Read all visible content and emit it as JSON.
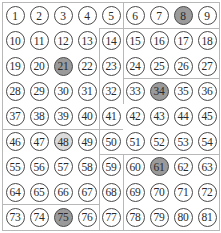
{
  "board": {
    "rows": 9,
    "cols": 9,
    "cells": [
      [
        1,
        2,
        3,
        4,
        5,
        6,
        7,
        8,
        9
      ],
      [
        10,
        11,
        12,
        13,
        14,
        15,
        16,
        17,
        18
      ],
      [
        19,
        20,
        21,
        22,
        23,
        24,
        25,
        26,
        27
      ],
      [
        28,
        29,
        30,
        31,
        32,
        33,
        34,
        35,
        36
      ],
      [
        37,
        38,
        39,
        40,
        41,
        42,
        43,
        44,
        45
      ],
      [
        46,
        47,
        48,
        49,
        50,
        51,
        52,
        53,
        54
      ],
      [
        55,
        56,
        57,
        58,
        59,
        60,
        61,
        62,
        63
      ],
      [
        64,
        65,
        66,
        67,
        68,
        69,
        70,
        71,
        72
      ],
      [
        73,
        74,
        75,
        76,
        77,
        78,
        79,
        80,
        81
      ]
    ],
    "shaded_dark": [
      8,
      21,
      34,
      61,
      75
    ],
    "shaded_light": [
      48
    ],
    "colors": {
      "circle_border": "#4a4a4a",
      "dark_fill": "#9a9a9a",
      "light_fill": "#dcdcdc",
      "region_line": "#b8b8b8"
    },
    "region_lines": [
      {
        "type": "v",
        "col": 5,
        "row_start": 0,
        "row_end": 1
      },
      {
        "type": "h",
        "row": 1,
        "col_start": 4,
        "col_end": 9
      },
      {
        "type": "v",
        "col": 4,
        "row_start": 1,
        "row_end": 3
      },
      {
        "type": "v",
        "col": 5,
        "row_start": 1,
        "row_end": 3
      },
      {
        "type": "h",
        "row": 3,
        "col_start": 5,
        "col_end": 9
      },
      {
        "type": "v",
        "col": 4,
        "row_start": 3,
        "row_end": 5
      },
      {
        "type": "v",
        "col": 5,
        "row_start": 3,
        "row_end": 4
      },
      {
        "type": "h",
        "row": 5,
        "col_start": 0,
        "col_end": 5
      },
      {
        "type": "v",
        "col": 4,
        "row_start": 5,
        "row_end": 6
      },
      {
        "type": "h",
        "row": 6,
        "col_start": 4,
        "col_end": 9
      },
      {
        "type": "v",
        "col": 4,
        "row_start": 6,
        "row_end": 9
      },
      {
        "type": "v",
        "col": 5,
        "row_start": 6,
        "row_end": 9
      },
      {
        "type": "h",
        "row": 8,
        "col_start": 0,
        "col_end": 4
      }
    ]
  }
}
